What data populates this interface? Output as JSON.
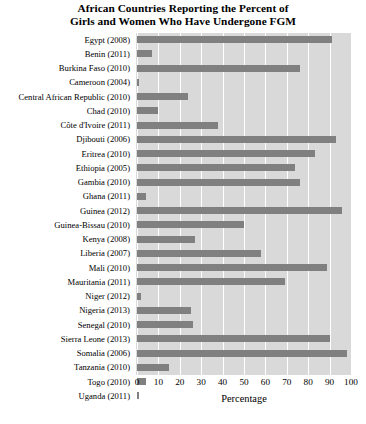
{
  "chart_data": {
    "type": "bar",
    "orientation": "horizontal",
    "title": "African Countries Reporting the Percent of Girls and Women Who Have Undergone FGM",
    "title_lines": [
      "African Countries Reporting the Percent of",
      "Girls and Women Who Have Undergone FGM"
    ],
    "xlabel": "Percentage",
    "ylabel": "",
    "xlim": [
      0,
      100
    ],
    "xticks": [
      0,
      10,
      20,
      30,
      40,
      50,
      60,
      70,
      80,
      90,
      100
    ],
    "xtick_labels": [
      "0",
      "10",
      "20",
      "30",
      "40",
      "50",
      "60",
      "70",
      "80",
      "90",
      "100"
    ],
    "grid": "vertical-white-on-gray",
    "legend": null,
    "bar_color": "#808080",
    "plot_background": "#d9d9d9",
    "gridline_color": "#ffffff",
    "categories": [
      "Egypt (2008)",
      "Benin (2011)",
      "Burkina Faso (2010)",
      "Cameroon (2004)",
      "Central African Republic (2010)",
      "Chad (2010)",
      "Côte d'Ivoire (2011)",
      "Djibouti (2006)",
      "Eritrea (2010)",
      "Ethiopia (2005)",
      "Gambia (2010)",
      "Ghana (2011)",
      "Guinea (2012)",
      "Guinea-Bissau (2010)",
      "Kenya (2008)",
      "Liberia (2007)",
      "Mali (2010)",
      "Mauritania (2011)",
      "Niger (2012)",
      "Nigeria (2013)",
      "Senegal (2010)",
      "Sierra Leone (2013)",
      "Somalia (2006)",
      "Tanzania (2010)",
      "Togo (2010)",
      "Uganda (2011)"
    ],
    "values": [
      91,
      7,
      76,
      1,
      24,
      10,
      38,
      93,
      83,
      74,
      76,
      4,
      96,
      50,
      27,
      58,
      89,
      69,
      2,
      25,
      26,
      90,
      98,
      15,
      4,
      1
    ]
  }
}
